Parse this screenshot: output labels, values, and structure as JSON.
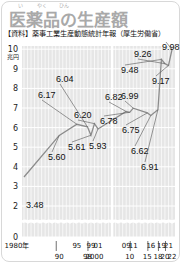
{
  "header": {
    "title": "医薬品の生産額",
    "ruby": [
      "い",
      "やく",
      "ひん"
    ],
    "source": "【資料】薬事工業生産動態統計年報（厚生労働省）"
  },
  "colors": {
    "title": "#a9a9a9",
    "plot_bg": "#e6e6e6",
    "grid": "#ffffff",
    "line": "#8c8c8c",
    "text": "#111111"
  },
  "chart_data": {
    "type": "line",
    "title": "医薬品の生産額",
    "source": "【資料】薬事工業生産動態統計年報（厚生労働省）",
    "xlabel": "",
    "ylabel": "兆円",
    "y_unit": "兆円",
    "ylim": [
      0,
      10
    ],
    "y_ticks": [
      0,
      2,
      3,
      4,
      5,
      6,
      7,
      8,
      9,
      10
    ],
    "y_axis_break": [
      0,
      2
    ],
    "grid": true,
    "x": [
      1980,
      1990,
      1995,
      1998,
      1999,
      2000,
      2001,
      2009,
      2010,
      2011,
      2015,
      2016,
      2018,
      2019,
      2020,
      2021,
      2022
    ],
    "x_tick_labels_top": [
      "1980年",
      "95",
      "99",
      "01",
      "09",
      "11",
      "16",
      "19",
      "21"
    ],
    "x_tick_labels_bottom": [
      "90",
      "98",
      "2000",
      "10",
      "15",
      "18",
      "20",
      "22"
    ],
    "series": [
      {
        "name": "医薬品の生産額",
        "values": [
          3.48,
          5.6,
          6.17,
          6.04,
          5.61,
          6.2,
          5.93,
          6.82,
          6.78,
          6.99,
          6.75,
          6.62,
          6.91,
          9.48,
          9.26,
          9.17,
          9.98
        ]
      }
    ],
    "data_labels": [
      "3.48",
      "5.60",
      "6.17",
      "6.04",
      "5.61",
      "6.20",
      "5.93",
      "6.82",
      "6.78",
      "6.99",
      "6.75",
      "6.62",
      "6.91",
      "9.48",
      "9.26",
      "9.17",
      "9.98"
    ]
  }
}
